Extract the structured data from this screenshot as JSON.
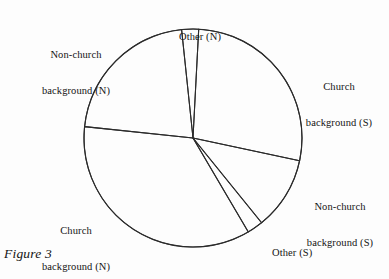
{
  "figure": {
    "caption": "Figure 3",
    "background_color": "#fdfdfd",
    "line_color": "#2b2b2b"
  },
  "labels": {
    "other_n": {
      "line1": "Other (N)",
      "line2": ""
    },
    "nonchurch_n": {
      "line1": "Non-church",
      "line2": "background (N)"
    },
    "church_s": {
      "line1": "Church",
      "line2": "background (S)"
    },
    "nonchurch_s": {
      "line1": "Non-church",
      "line2": "background (S)"
    },
    "church_n": {
      "line1": "Church",
      "line2": "background (N)"
    },
    "other_s": {
      "line1": "Other (S)",
      "line2": ""
    }
  },
  "chart_data": {
    "type": "pie",
    "title": "Figure 3",
    "subtitle": "",
    "xlabel": "",
    "ylabel": "",
    "legend_position": "callout-labels-outside",
    "grid": false,
    "units": "percent",
    "center": {
      "x": 193,
      "y": 138
    },
    "radius": 109,
    "start_angle_deg": -88,
    "direction": "clockwise",
    "slices": [
      {
        "label": "Church background (S)",
        "value": 35.0,
        "start_angle_deg": -87.0,
        "end_angle_deg": 12.0,
        "label_key": "church_s"
      },
      {
        "label": "Non-church background (S)",
        "value": 17.0,
        "start_angle_deg": 12.0,
        "end_angle_deg": 51.0,
        "label_key": "nonchurch_s"
      },
      {
        "label": "Other (S)",
        "value": 3.5,
        "start_angle_deg": 51.0,
        "end_angle_deg": 59.5,
        "label_key": "other_s"
      },
      {
        "label": "Church background (N)",
        "value": 36.0,
        "start_angle_deg": 59.5,
        "end_angle_deg": 186.0,
        "label_key": "church_n"
      },
      {
        "label": "Non-church background (N)",
        "value": 5.5,
        "start_angle_deg": 186.0,
        "end_angle_deg": 264.0,
        "label_key": "nonchurch_n"
      },
      {
        "label": "Other (N)",
        "value": 3.0,
        "start_angle_deg": 264.0,
        "end_angle_deg": 273.0,
        "label_key": "other_n"
      }
    ],
    "categories": [
      "Church background (S)",
      "Non-church background (S)",
      "Other (S)",
      "Church background (N)",
      "Non-church background (N)",
      "Other (N)"
    ],
    "values": [
      35.0,
      17.0,
      3.5,
      36.0,
      5.5,
      3.0
    ]
  }
}
